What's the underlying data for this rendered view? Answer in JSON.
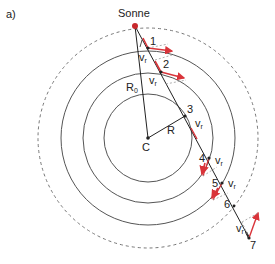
{
  "panel_label": "a)",
  "sun_label": "Sonne",
  "center_label": "C",
  "radius_labels": {
    "R0": "R",
    "R0_sub": "0",
    "R": "R"
  },
  "velocity_label": {
    "base": "v",
    "sub": "r"
  },
  "points": [
    "1",
    "2",
    "3",
    "4",
    "5",
    "6",
    "7"
  ],
  "colors": {
    "sun": "#c8282d",
    "arrow": "#d9343a",
    "line": "#222222",
    "circle": "#555555",
    "dashed": "#777777",
    "dashed_arrow": "#9a9a9a"
  }
}
